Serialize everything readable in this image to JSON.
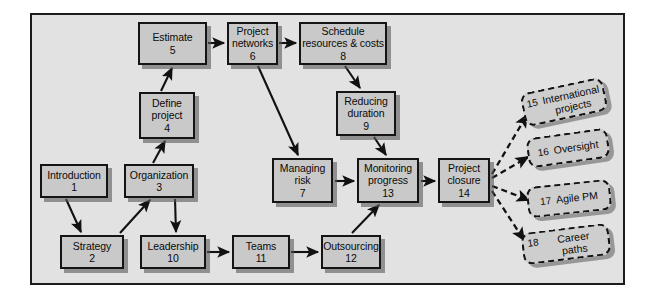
{
  "figure": {
    "background_color": "#e2e2e2",
    "frame_color": "#1c1c1c",
    "node_fill": "#c9c9c9",
    "supplement_fill": "#cecece"
  },
  "nodes": [
    {
      "id": "introduction",
      "title": "Introduction",
      "number": "1",
      "x": 40,
      "y": 164,
      "w": 68,
      "h": 34
    },
    {
      "id": "strategy",
      "title": "Strategy",
      "number": "2",
      "x": 60,
      "y": 235,
      "w": 64,
      "h": 34
    },
    {
      "id": "organization",
      "title": "Organization",
      "number": "3",
      "x": 124,
      "y": 164,
      "w": 70,
      "h": 34
    },
    {
      "id": "define",
      "title": "Define project",
      "number": "4",
      "x": 139,
      "y": 92,
      "w": 56,
      "h": 47
    },
    {
      "id": "estimate",
      "title": "Estimate",
      "number": "5",
      "x": 138,
      "y": 22,
      "w": 69,
      "h": 43
    },
    {
      "id": "networks",
      "title": "Project networks",
      "number": "6",
      "x": 227,
      "y": 22,
      "w": 51,
      "h": 43
    },
    {
      "id": "risk",
      "title": "Managing risk",
      "number": "7",
      "x": 272,
      "y": 158,
      "w": 61,
      "h": 45
    },
    {
      "id": "schedule",
      "title": "Schedule resources & costs",
      "number": "8",
      "x": 299,
      "y": 22,
      "w": 88,
      "h": 43
    },
    {
      "id": "reducing",
      "title": "Reducing duration",
      "number": "9",
      "x": 336,
      "y": 91,
      "w": 60,
      "h": 45
    },
    {
      "id": "leadership",
      "title": "Leadership",
      "number": "10",
      "x": 140,
      "y": 235,
      "w": 66,
      "h": 34
    },
    {
      "id": "teams",
      "title": "Teams",
      "number": "11",
      "x": 232,
      "y": 235,
      "w": 58,
      "h": 34
    },
    {
      "id": "outsourcing",
      "title": "Outsourcing",
      "number": "12",
      "x": 321,
      "y": 235,
      "w": 60,
      "h": 34
    },
    {
      "id": "monitoring",
      "title": "Monitoring progress",
      "number": "13",
      "x": 357,
      "y": 158,
      "w": 62,
      "h": 45
    },
    {
      "id": "closure",
      "title": "Project closure",
      "number": "14",
      "x": 438,
      "y": 158,
      "w": 52,
      "h": 45
    }
  ],
  "supplements": [
    {
      "id": "international",
      "label": "International projects",
      "number": "15",
      "x": 522,
      "y": 85,
      "w": 84,
      "h": 34,
      "rotate": -12
    },
    {
      "id": "oversight",
      "label": "Oversight",
      "number": "16",
      "x": 527,
      "y": 133,
      "w": 82,
      "h": 30,
      "rotate": -8
    },
    {
      "id": "agile",
      "label": "Agile PM",
      "number": "17",
      "x": 527,
      "y": 183,
      "w": 84,
      "h": 31,
      "rotate": -6
    },
    {
      "id": "career",
      "label": "Career paths",
      "number": "18",
      "x": 522,
      "y": 228,
      "w": 88,
      "h": 32,
      "rotate": -7
    }
  ],
  "connections": [
    {
      "from": "introduction",
      "to": "strategy",
      "style": "solid"
    },
    {
      "from": "strategy",
      "to": "organization",
      "style": "solid"
    },
    {
      "from": "organization",
      "to": "define",
      "style": "solid"
    },
    {
      "from": "organization",
      "to": "leadership",
      "style": "solid"
    },
    {
      "from": "define",
      "to": "estimate",
      "style": "solid"
    },
    {
      "from": "estimate",
      "to": "networks",
      "style": "solid"
    },
    {
      "from": "networks",
      "to": "schedule",
      "style": "solid"
    },
    {
      "from": "networks",
      "to": "risk",
      "style": "solid"
    },
    {
      "from": "schedule",
      "to": "reducing",
      "style": "solid"
    },
    {
      "from": "reducing",
      "to": "monitoring",
      "style": "solid"
    },
    {
      "from": "risk",
      "to": "monitoring",
      "style": "solid"
    },
    {
      "from": "leadership",
      "to": "teams",
      "style": "solid"
    },
    {
      "from": "teams",
      "to": "outsourcing",
      "style": "solid"
    },
    {
      "from": "outsourcing",
      "to": "monitoring",
      "style": "solid"
    },
    {
      "from": "monitoring",
      "to": "closure",
      "style": "solid"
    },
    {
      "from": "closure",
      "to": "international",
      "style": "dashed"
    },
    {
      "from": "closure",
      "to": "oversight",
      "style": "dashed"
    },
    {
      "from": "closure",
      "to": "agile",
      "style": "dashed"
    },
    {
      "from": "closure",
      "to": "career",
      "style": "dashed"
    }
  ]
}
